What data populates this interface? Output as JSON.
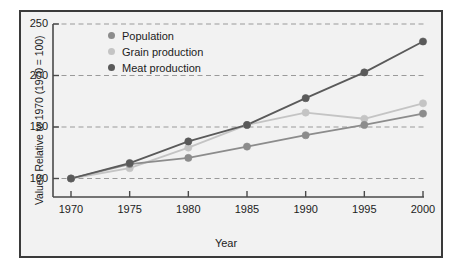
{
  "chart_data": {
    "type": "line",
    "title": "",
    "xlabel": "Year",
    "ylabel": "Values Relative to 1970 (1970 = 100)",
    "categories": [
      1970,
      1975,
      1980,
      1985,
      1990,
      1995,
      2000
    ],
    "x_tick_labels": [
      "1970",
      "1975",
      "1980",
      "1985",
      "1990",
      "1995",
      "2000"
    ],
    "y_tick_labels": [
      "100",
      "150",
      "200",
      "250"
    ],
    "y_ticks": [
      100,
      150,
      200,
      250
    ],
    "xlim": [
      1970,
      2000
    ],
    "ylim": [
      85,
      250
    ],
    "grid": true,
    "grid_style": "dashed-horizontal",
    "legend_position": "top-left-inside",
    "series": [
      {
        "name": "Population",
        "color": "#8c8c8c",
        "values": [
          100,
          114,
          120,
          131,
          142,
          152,
          163
        ]
      },
      {
        "name": "Grain production",
        "color": "#c4c4c4",
        "values": [
          100,
          110,
          130,
          152,
          164,
          158,
          173
        ]
      },
      {
        "name": "Meat production",
        "color": "#5a5a5a",
        "values": [
          100,
          115,
          136,
          152,
          178,
          203,
          233
        ]
      }
    ]
  },
  "colors": {
    "frame_border": "#3a3a3a",
    "plot_background": "#f2f2f2",
    "axis_line": "#4a4a4a",
    "gridline": "#9a9a9a",
    "text": "#1c1c1c"
  },
  "legend": {
    "items": [
      {
        "label": "Population",
        "color": "#8c8c8c"
      },
      {
        "label": "Grain production",
        "color": "#c4c4c4"
      },
      {
        "label": "Meat production",
        "color": "#5a5a5a"
      }
    ]
  }
}
